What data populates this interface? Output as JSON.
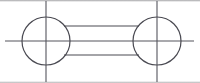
{
  "figure": {
    "background_color": "#ffffff",
    "line_color": "#4a4a52",
    "centerline_color": "#55555d",
    "stroke_width": 1,
    "canvas": {
      "width": 200,
      "height": 83
    }
  },
  "geometry": {
    "circles": [
      {
        "name": "left-circle",
        "cx": 46,
        "cy": 41,
        "r": 24
      },
      {
        "name": "right-circle",
        "cx": 157,
        "cy": 41,
        "r": 24
      }
    ],
    "connector_bar": {
      "name": "connecting-bar",
      "x1": 64,
      "x2": 139,
      "top_y": 26,
      "bottom_y": 55
    },
    "centerlines": {
      "horizontal": {
        "x1": 5,
        "x2": 194,
        "y": 41
      },
      "vertical_left": {
        "x": 46,
        "y1": 1,
        "y2": 82
      },
      "vertical_right": {
        "x": 157,
        "y1": 1,
        "y2": 82
      }
    }
  },
  "labels": {
    "left_circle": "left boss circle",
    "right_circle": "right boss circle",
    "bar": "connecting web",
    "axis": "centreline"
  }
}
